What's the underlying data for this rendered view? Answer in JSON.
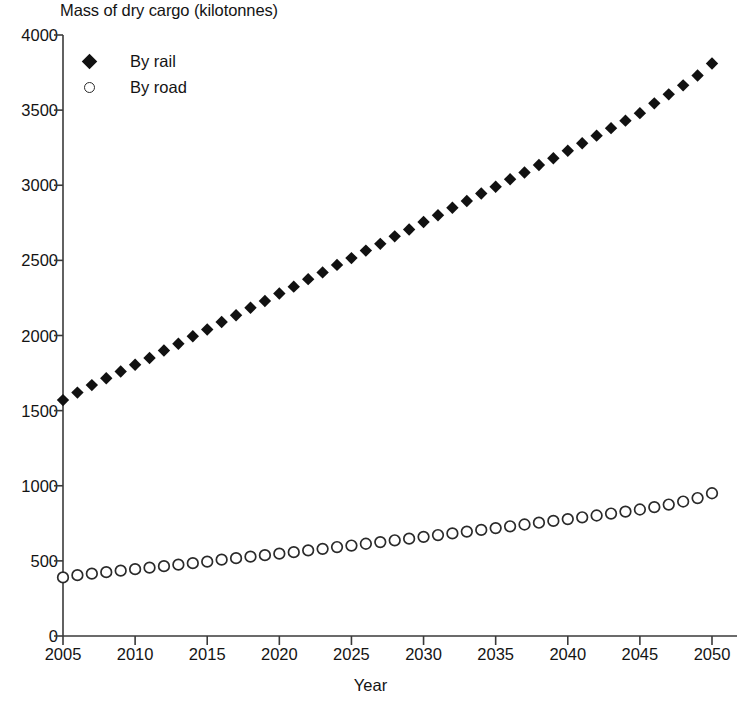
{
  "chart_data": {
    "type": "scatter",
    "title": "Mass of dry cargo (kilotonnes)",
    "xlabel": "Year",
    "ylabel": "",
    "xlim": [
      2005,
      2050
    ],
    "ylim": [
      0,
      4000
    ],
    "grid": false,
    "legend_position": "top-left",
    "x_ticks": [
      "2005",
      "2010",
      "2015",
      "2020",
      "2025",
      "2030",
      "2035",
      "2040",
      "2045",
      "2050"
    ],
    "x_tick_values": [
      2005,
      2010,
      2015,
      2020,
      2025,
      2030,
      2035,
      2040,
      2045,
      2050
    ],
    "y_ticks": [
      "0",
      "500",
      "1000",
      "1500",
      "2000",
      "2500",
      "3000",
      "3500",
      "4000"
    ],
    "y_tick_values": [
      0,
      500,
      1000,
      1500,
      2000,
      2500,
      3000,
      3500,
      4000
    ],
    "x": [
      2005,
      2006,
      2007,
      2008,
      2009,
      2010,
      2011,
      2012,
      2013,
      2014,
      2015,
      2016,
      2017,
      2018,
      2019,
      2020,
      2021,
      2022,
      2023,
      2024,
      2025,
      2026,
      2027,
      2028,
      2029,
      2030,
      2031,
      2032,
      2033,
      2034,
      2035,
      2036,
      2037,
      2038,
      2039,
      2040,
      2041,
      2042,
      2043,
      2044,
      2045,
      2046,
      2047,
      2048,
      2049,
      2050
    ],
    "series": [
      {
        "name": "By rail",
        "marker": "filled-diamond",
        "color": "#111111",
        "values": [
          1570,
          1620,
          1670,
          1715,
          1760,
          1805,
          1850,
          1900,
          1945,
          1995,
          2040,
          2090,
          2135,
          2185,
          2230,
          2280,
          2325,
          2375,
          2420,
          2470,
          2515,
          2565,
          2610,
          2660,
          2705,
          2755,
          2800,
          2850,
          2895,
          2945,
          2990,
          3040,
          3085,
          3135,
          3180,
          3230,
          3280,
          3330,
          3380,
          3430,
          3480,
          3545,
          3605,
          3665,
          3730,
          3810
        ]
      },
      {
        "name": "By road",
        "marker": "open-circle",
        "color": "#2a2a2a",
        "values": [
          390,
          405,
          415,
          425,
          435,
          445,
          455,
          465,
          475,
          485,
          495,
          508,
          518,
          528,
          538,
          548,
          558,
          570,
          580,
          592,
          602,
          614,
          625,
          637,
          648,
          660,
          672,
          683,
          695,
          706,
          718,
          730,
          742,
          754,
          766,
          778,
          790,
          802,
          815,
          828,
          842,
          858,
          875,
          895,
          918,
          950
        ]
      }
    ]
  }
}
